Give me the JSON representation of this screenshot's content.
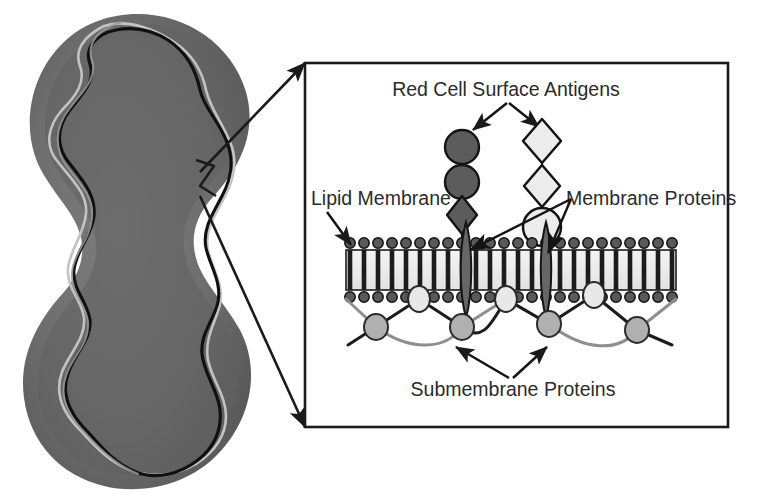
{
  "figure": {
    "background_color": "#ffffff"
  },
  "cell": {
    "name": "red-blood-cell",
    "shape_description": "biconcave dumbbell cross-section",
    "fill_color": "#6e6e6e",
    "shadow_color": "#4f4f4f",
    "outline_dark_color": "#111111",
    "outline_light_color": "#b9b9b9",
    "bounds": {
      "x": 22,
      "y": 14,
      "width": 238,
      "height": 476
    }
  },
  "callout": {
    "name": "magnification-callout",
    "line_color": "#1a1a1a",
    "from_x": 200,
    "from_y": 172,
    "to_top_x": 305,
    "to_top_y": 63,
    "to_bottom_x": 305,
    "to_bottom_y": 427
  },
  "inset": {
    "name": "membrane-detail-inset",
    "border_color": "#1a1a1a",
    "x": 305,
    "y": 63,
    "width": 423,
    "height": 364
  },
  "labels": [
    {
      "id": "red-cell-surface-antigens",
      "text": "Red Cell Surface Antigens",
      "x": 506,
      "y": 96,
      "anchor": "middle"
    },
    {
      "id": "lipid-membrane",
      "text": "Lipid Membrane",
      "x": 311,
      "y": 205,
      "anchor": "start"
    },
    {
      "id": "membrane-proteins",
      "text": "Membrane Proteins",
      "x": 566,
      "y": 205,
      "anchor": "start"
    },
    {
      "id": "submembrane-proteins",
      "text": "Submembrane Proteins",
      "x": 513,
      "y": 396,
      "anchor": "middle"
    }
  ],
  "membrane": {
    "name": "lipid-bilayer",
    "x": 346,
    "y": 246,
    "width": 330,
    "height": 46,
    "interior_color": "#efefef",
    "tail_color": "#1c1c1c",
    "head_color": "#595959",
    "head_outline": "#111111",
    "head_count_per_row": 23,
    "head_radius": 5.2,
    "tail_count": 23
  },
  "antigen_chains": [
    {
      "id": "antigen-chain-dark",
      "fill_color": "#5c5c5c",
      "stroke_color": "#141414",
      "stem_x": 462,
      "units": [
        {
          "shape": "circle",
          "cx": 462,
          "cy": 147,
          "r": 17
        },
        {
          "shape": "circle",
          "cx": 462,
          "cy": 182,
          "r": 17
        },
        {
          "shape": "diamond",
          "cx": 462,
          "cy": 215,
          "rx": 15,
          "ry": 19
        }
      ]
    },
    {
      "id": "antigen-chain-light",
      "fill_color": "#ececec",
      "stroke_color": "#141414",
      "stem_x": 542,
      "units": [
        {
          "shape": "diamond",
          "cx": 542,
          "cy": 141,
          "rx": 19,
          "ry": 22
        },
        {
          "shape": "diamond",
          "cx": 542,
          "cy": 186,
          "rx": 18,
          "ry": 21
        },
        {
          "shape": "circle",
          "cx": 542,
          "cy": 227,
          "r": 19
        }
      ]
    }
  ],
  "transmembrane_proteins": [
    {
      "id": "transmembrane-protein-left",
      "cx": 466,
      "cy": 269,
      "half_width": 7,
      "top_y": 222,
      "bottom_y": 318,
      "fill_color": "#666666",
      "stroke_color": "#151515"
    },
    {
      "id": "transmembrane-protein-right",
      "cx": 546,
      "cy": 269,
      "half_width": 7,
      "top_y": 222,
      "bottom_y": 318,
      "fill_color": "#666666",
      "stroke_color": "#151515"
    }
  ],
  "submembrane_network": {
    "name": "spectrin-cytoskeleton",
    "dark_line_color": "#1b1b1b",
    "gray_line_color": "#8e8e8e",
    "upper_node_fill": "#e8e8e8",
    "lower_node_fill": "#b0b0b0",
    "node_stroke": "#2a2a2a",
    "upper_nodes": [
      {
        "cx": 419,
        "cy": 299,
        "rx": 11,
        "ry": 13
      },
      {
        "cx": 506,
        "cy": 299,
        "rx": 11,
        "ry": 13
      },
      {
        "cx": 594,
        "cy": 295,
        "rx": 11,
        "ry": 13
      }
    ],
    "lower_node_y": 325,
    "lower_nodes": [
      {
        "cx": 376,
        "cy": 327,
        "rx": 12,
        "ry": 13
      },
      {
        "cx": 462,
        "cy": 327,
        "rx": 12,
        "ry": 13
      },
      {
        "cx": 549,
        "cy": 324,
        "rx": 12,
        "ry": 13
      },
      {
        "cx": 637,
        "cy": 330,
        "rx": 12,
        "ry": 13
      }
    ]
  },
  "arrows": {
    "antigen_left": {
      "from_x": 497,
      "from_y": 105,
      "to_x": 471,
      "to_y": 131
    },
    "antigen_right": {
      "from_x": 517,
      "from_y": 105,
      "to_x": 541,
      "to_y": 128
    },
    "lipid_membrane": {
      "from_x": 330,
      "from_y": 214,
      "to_x": 351,
      "to_y": 246
    },
    "membrane_protein_left": {
      "from_x": 572,
      "from_y": 200,
      "to_x": 468,
      "to_y": 249
    },
    "membrane_protein_right": {
      "from_x": 572,
      "from_y": 200,
      "to_x": 549,
      "to_y": 252
    },
    "submembrane_left": {
      "from_x": 505,
      "from_y": 378,
      "to_x": 453,
      "to_y": 345
    },
    "submembrane_right": {
      "from_x": 516,
      "from_y": 378,
      "to_x": 549,
      "to_y": 345
    }
  }
}
